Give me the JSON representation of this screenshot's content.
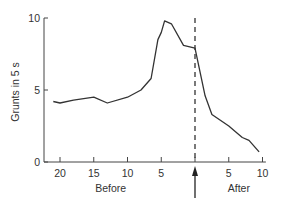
{
  "chart_data": {
    "type": "line",
    "title": "",
    "xlabel_left": "Before",
    "xlabel_right": "After",
    "ylabel": "Grunts in 5 s",
    "ylim": [
      0,
      10
    ],
    "xlim": [
      -22,
      10.5
    ],
    "grid": false,
    "legend": null,
    "y_ticks": [
      0,
      5,
      10
    ],
    "x_ticks": [
      {
        "pos": -20,
        "label": "20"
      },
      {
        "pos": -15,
        "label": "15"
      },
      {
        "pos": -10,
        "label": "10"
      },
      {
        "pos": -5,
        "label": "5"
      },
      {
        "pos": 0,
        "label": ""
      },
      {
        "pos": 5,
        "label": "5"
      },
      {
        "pos": 10,
        "label": "10"
      }
    ],
    "event_marker": {
      "x": 0,
      "style": "dashed vertical line",
      "annotation": "upward arrow below axis"
    },
    "series": [
      {
        "name": "Grunts",
        "color": "#333333",
        "x": [
          -21,
          -20,
          -18,
          -15,
          -13,
          -10,
          -8,
          -6.5,
          -5.5,
          -5,
          -4.5,
          -3.5,
          -1.7,
          0,
          1.5,
          2.5,
          5,
          6,
          7,
          8,
          9.5
        ],
        "values": [
          4.2,
          4.1,
          4.3,
          4.5,
          4.1,
          4.5,
          5.0,
          5.8,
          8.5,
          9.0,
          9.8,
          9.6,
          8.1,
          7.9,
          4.6,
          3.3,
          2.5,
          2.1,
          1.7,
          1.5,
          0.7
        ]
      }
    ]
  }
}
